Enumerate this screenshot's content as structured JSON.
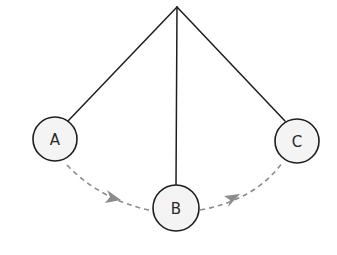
{
  "diagram": {
    "pivot": {
      "x": 177,
      "y": 7
    },
    "bobs": [
      {
        "id": "A",
        "label": "A",
        "cx": 55,
        "cy": 139,
        "r": 22
      },
      {
        "id": "B",
        "label": "B",
        "cx": 176,
        "cy": 208,
        "r": 23
      },
      {
        "id": "C",
        "label": "C",
        "cx": 297,
        "cy": 141,
        "r": 22
      }
    ],
    "strings": [
      {
        "to": "A",
        "x2": 68,
        "y2": 121
      },
      {
        "to": "B",
        "x2": 176,
        "y2": 185
      },
      {
        "to": "C",
        "x2": 285,
        "y2": 121
      }
    ],
    "arcs": [
      {
        "from": "A",
        "to": "B",
        "style": "dashed",
        "arrow": "midpoint"
      },
      {
        "from": "B",
        "to": "C",
        "style": "dashed",
        "arrow": "midpoint"
      }
    ],
    "colors": {
      "stroke": "#1e1e1e",
      "bob_fill": "#f4f4f4",
      "arc": "#8c8c8c",
      "label": "#2a2a2a",
      "background": "#ffffff"
    }
  }
}
